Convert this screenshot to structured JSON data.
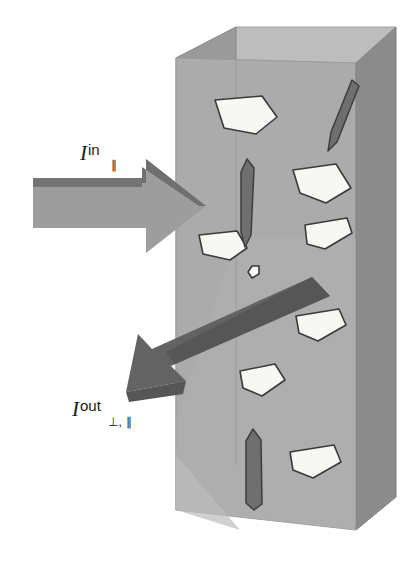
{
  "figure": {
    "canvas": {
      "width": 411,
      "height": 562,
      "background": "#ffffff"
    },
    "colors": {
      "background": "#ffffff",
      "box_front_face": "#a8a8a8",
      "box_left_face": "#909090",
      "box_top_face": "#bdbdbd",
      "box_right_face": "#8a8a8a",
      "box_edge": "#8e8e8e",
      "arrow_in_body": "#9a9a9a",
      "arrow_in_bevel": "#6e6e6e",
      "arrow_out_body": "#636363",
      "arrow_out_bevel": "#545454",
      "particle_bright": "#f7f7f4",
      "particle_bright_stroke": "#3a3a3a",
      "particle_dark": "#6f6f6f",
      "particle_dark_stroke": "#3a3a3a",
      "label_text": "#1a1a1a"
    }
  },
  "labels": {
    "incident": {
      "symbol": "I",
      "superscript": "in",
      "subscript": "∥",
      "meaning": "incident-parallel-polarized-intensity"
    },
    "outgoing": {
      "symbol": "I",
      "superscript": "out",
      "subscript": "⊥, ∥",
      "meaning": "outgoing-perpendicular-and-parallel-polarized-intensity"
    }
  },
  "medium": {
    "name": "scattering-slab",
    "description": "Rectangular 3D slab drawn in oblique projection with three visible faces"
  },
  "arrows": [
    {
      "name": "incident-beam-arrow",
      "direction": "right",
      "label_ref": "incident",
      "style": "3d-block-arrow"
    },
    {
      "name": "scattered-beam-arrow",
      "direction": "down-left",
      "label_ref": "outgoing",
      "style": "3d-block-arrow"
    }
  ],
  "particles": {
    "bright_count": 8,
    "dark_count": 3,
    "bright_label": "bright-scatterer",
    "dark_label": "dark-scatterer"
  }
}
